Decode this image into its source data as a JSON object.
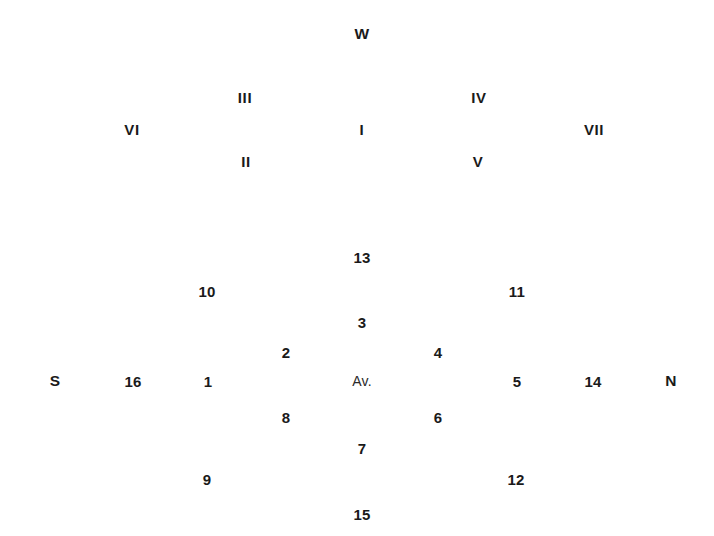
{
  "diagram": {
    "title": "",
    "background_color": "#ffffff",
    "text_color": "#1a1a1a",
    "width": 714,
    "height": 536,
    "center_label": {
      "text": "Av.",
      "x": 362,
      "y": 381
    },
    "cardinals": [
      {
        "name": "west",
        "text": "W",
        "x": 362,
        "y": 34
      },
      {
        "name": "south",
        "text": "S",
        "x": 55,
        "y": 381
      },
      {
        "name": "north",
        "text": "N",
        "x": 671,
        "y": 381
      }
    ],
    "roman_numerals": [
      {
        "name": "roman-vi",
        "text": "VI",
        "x": 132,
        "y": 129
      },
      {
        "name": "roman-iii",
        "text": "III",
        "x": 245,
        "y": 97
      },
      {
        "name": "roman-ii",
        "text": "II",
        "x": 246,
        "y": 161
      },
      {
        "name": "roman-i",
        "text": "I",
        "x": 362,
        "y": 129
      },
      {
        "name": "roman-iv",
        "text": "IV",
        "x": 479,
        "y": 97
      },
      {
        "name": "roman-v",
        "text": "V",
        "x": 478,
        "y": 161
      },
      {
        "name": "roman-vii",
        "text": "VII",
        "x": 594,
        "y": 129
      }
    ],
    "numerals": [
      {
        "name": "num-13",
        "text": "13",
        "x": 362,
        "y": 257
      },
      {
        "name": "num-10",
        "text": "10",
        "x": 207,
        "y": 291
      },
      {
        "name": "num-11",
        "text": "11",
        "x": 517,
        "y": 291
      },
      {
        "name": "num-3",
        "text": "3",
        "x": 362,
        "y": 322
      },
      {
        "name": "num-2",
        "text": "2",
        "x": 286,
        "y": 352
      },
      {
        "name": "num-4",
        "text": "4",
        "x": 438,
        "y": 352
      },
      {
        "name": "num-16",
        "text": "16",
        "x": 133,
        "y": 381
      },
      {
        "name": "num-1",
        "text": "1",
        "x": 208,
        "y": 381
      },
      {
        "name": "num-5",
        "text": "5",
        "x": 517,
        "y": 381
      },
      {
        "name": "num-14",
        "text": "14",
        "x": 593,
        "y": 381
      },
      {
        "name": "num-8",
        "text": "8",
        "x": 286,
        "y": 417
      },
      {
        "name": "num-6",
        "text": "6",
        "x": 438,
        "y": 417
      },
      {
        "name": "num-7",
        "text": "7",
        "x": 362,
        "y": 448
      },
      {
        "name": "num-9",
        "text": "9",
        "x": 207,
        "y": 479
      },
      {
        "name": "num-12",
        "text": "12",
        "x": 516,
        "y": 479
      },
      {
        "name": "num-15",
        "text": "15",
        "x": 362,
        "y": 514
      }
    ]
  }
}
